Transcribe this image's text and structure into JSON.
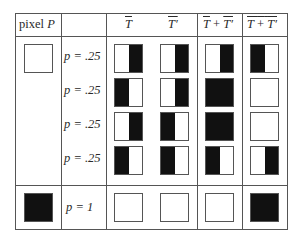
{
  "header": {
    "col1": "pixel P",
    "col1_word": "pixel",
    "col1_var": "P",
    "col2": "",
    "col3a": "T",
    "col3b": "T′",
    "col4": "T + T′",
    "col4_a": "T",
    "col4_plus": "+",
    "col4_b": "T′",
    "col5": "T + T′ (overlined)",
    "col5_a": "T",
    "col5_plus": "+",
    "col5_b": "T′"
  },
  "rows": [
    {
      "pixel": "white",
      "p": "p = .25",
      "T": "right-black",
      "Tp": "right-black",
      "sum": "right-black",
      "neg": "left-black"
    },
    {
      "pixel": "",
      "p": "p = .25",
      "T": "left-black",
      "Tp": "right-black",
      "sum": "full-black",
      "neg": "white"
    },
    {
      "pixel": "",
      "p": "p = .25",
      "T": "right-black",
      "Tp": "left-black",
      "sum": "full-black",
      "neg": "white"
    },
    {
      "pixel": "",
      "p": "p = .25",
      "T": "left-black",
      "Tp": "left-black",
      "sum": "left-black",
      "neg": "right-black"
    },
    {
      "pixel": "black",
      "p": "p = 1",
      "T": "white",
      "Tp": "white",
      "sum": "white",
      "neg": "full-black"
    }
  ],
  "colors": {
    "black": "#111111",
    "border": "#555555",
    "background": "#ffffff"
  }
}
